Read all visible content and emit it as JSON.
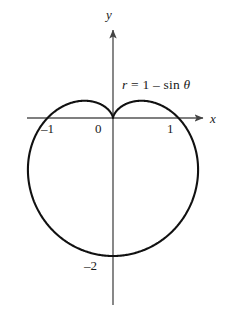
{
  "figure": {
    "background_color": "#ffffff",
    "curve_color": "#111111",
    "axis_color": "#555555",
    "text_color": "#1a1a1a"
  },
  "axes": {
    "x_axis_label": "x",
    "y_axis_label": "y",
    "x_ticks": [
      {
        "value": -1,
        "label": "–1"
      },
      {
        "value": 0,
        "label": "0"
      },
      {
        "value": 1,
        "label": "1"
      }
    ],
    "y_ticks": [
      {
        "value": -2,
        "label": "–2"
      }
    ],
    "origin_label": "0",
    "x_arrow": "right-arrow-icon",
    "y_arrow": "up-arrow-icon"
  },
  "annotations": {
    "equation": {
      "full_text": "r = 1 – sin θ",
      "variable": "r",
      "equals": "=",
      "constant": "1",
      "minus": "–",
      "function": "sin",
      "angle": "θ"
    }
  },
  "chart_data": {
    "type": "line",
    "subtype": "polar-cardioid",
    "title": "",
    "equation": "r = 1 - sin θ",
    "polar": {
      "r_of_theta": "1 - sin(theta)",
      "theta_range_deg": [
        0,
        360
      ],
      "r_min": 0,
      "r_max": 2,
      "cusp_at_theta_deg": 90,
      "cusp_point_xy": [
        0,
        0
      ]
    },
    "xlabel": "x",
    "ylabel": "y",
    "xlim": [
      -1.55,
      1.45
    ],
    "ylim": [
      -2.35,
      2.1
    ],
    "grid": false,
    "legend": null,
    "key_points": [
      {
        "theta_deg": 0,
        "r": 1,
        "x": 1,
        "y": 0,
        "label": "1"
      },
      {
        "theta_deg": 90,
        "r": 0,
        "x": 0,
        "y": 0,
        "label": "0"
      },
      {
        "theta_deg": 180,
        "r": 1,
        "x": -1,
        "y": 0,
        "label": "–1"
      },
      {
        "theta_deg": 270,
        "r": 2,
        "x": 0,
        "y": -2,
        "label": "–2"
      }
    ],
    "extrema": {
      "max_abs_x": 1.299,
      "max_y": 0.125,
      "min_y": -2.0
    },
    "series": [
      {
        "name": "r = 1 - sin θ",
        "color": "#111111",
        "line_width": 2.1,
        "closed": true
      }
    ]
  }
}
